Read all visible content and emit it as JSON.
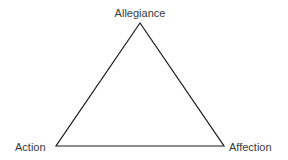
{
  "diagram": {
    "type": "triangle",
    "stroke_color": "#1a1a1a",
    "vertices": {
      "top": {
        "label": "Allegiance",
        "x": 140,
        "y": 23
      },
      "bottom_left": {
        "label": "Action",
        "x": 56,
        "y": 146
      },
      "bottom_right": {
        "label": "Affection",
        "x": 224,
        "y": 146
      }
    }
  }
}
